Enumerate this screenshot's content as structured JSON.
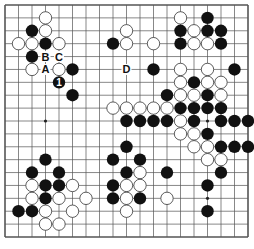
{
  "board": {
    "size": 19,
    "hoshi": [
      [
        3,
        9
      ],
      [
        15,
        9
      ],
      [
        15,
        15
      ]
    ],
    "black": [
      [
        2,
        2
      ],
      [
        3,
        3
      ],
      [
        2,
        4
      ],
      [
        5,
        5
      ],
      [
        5,
        7
      ],
      [
        8,
        3
      ],
      [
        11,
        5
      ],
      [
        15,
        1
      ],
      [
        13,
        2
      ],
      [
        15,
        2
      ],
      [
        16,
        2
      ],
      [
        13,
        3
      ],
      [
        16,
        3
      ],
      [
        17,
        5
      ],
      [
        14,
        6
      ],
      [
        12,
        7
      ],
      [
        15,
        7
      ],
      [
        13,
        8
      ],
      [
        14,
        8
      ],
      [
        15,
        8
      ],
      [
        16,
        8
      ],
      [
        9,
        9
      ],
      [
        10,
        9
      ],
      [
        11,
        9
      ],
      [
        12,
        9
      ],
      [
        14,
        9
      ],
      [
        16,
        9
      ],
      [
        17,
        9
      ],
      [
        18,
        9
      ],
      [
        15,
        10
      ],
      [
        16,
        11
      ],
      [
        17,
        11
      ],
      [
        18,
        11
      ],
      [
        16,
        13
      ],
      [
        15,
        14
      ],
      [
        15,
        16
      ],
      [
        3,
        12
      ],
      [
        2,
        13
      ],
      [
        4,
        13
      ],
      [
        3,
        14
      ],
      [
        4,
        14
      ],
      [
        3,
        15
      ],
      [
        1,
        16
      ],
      [
        2,
        16
      ],
      [
        9,
        11
      ],
      [
        8,
        12
      ],
      [
        10,
        12
      ],
      [
        9,
        13
      ],
      [
        12,
        13
      ],
      [
        8,
        14
      ],
      [
        8,
        15
      ],
      [
        10,
        15
      ]
    ],
    "white": [
      [
        3,
        1
      ],
      [
        3,
        2
      ],
      [
        1,
        3
      ],
      [
        2,
        3
      ],
      [
        4,
        3
      ],
      [
        2,
        5
      ],
      [
        4,
        5
      ],
      [
        9,
        2
      ],
      [
        9,
        3
      ],
      [
        11,
        3
      ],
      [
        13,
        1
      ],
      [
        14,
        2
      ],
      [
        14,
        3
      ],
      [
        15,
        3
      ],
      [
        13,
        5
      ],
      [
        15,
        5
      ],
      [
        13,
        6
      ],
      [
        15,
        6
      ],
      [
        16,
        6
      ],
      [
        13,
        7
      ],
      [
        14,
        7
      ],
      [
        16,
        7
      ],
      [
        8,
        8
      ],
      [
        9,
        8
      ],
      [
        10,
        8
      ],
      [
        11,
        8
      ],
      [
        12,
        8
      ],
      [
        13,
        9
      ],
      [
        13,
        10
      ],
      [
        14,
        10
      ],
      [
        14,
        11
      ],
      [
        15,
        11
      ],
      [
        15,
        12
      ],
      [
        16,
        12
      ],
      [
        2,
        14
      ],
      [
        5,
        14
      ],
      [
        2,
        15
      ],
      [
        4,
        15
      ],
      [
        6,
        15
      ],
      [
        3,
        16
      ],
      [
        5,
        16
      ],
      [
        3,
        17
      ],
      [
        4,
        17
      ],
      [
        10,
        13
      ],
      [
        9,
        14
      ],
      [
        10,
        14
      ],
      [
        9,
        15
      ],
      [
        12,
        15
      ],
      [
        9,
        16
      ]
    ],
    "numbered": [
      {
        "pos": [
          4,
          6
        ],
        "color": "black",
        "label": "1"
      }
    ],
    "labels": [
      {
        "pos": [
          3,
          4
        ],
        "text": "B"
      },
      {
        "pos": [
          4,
          4
        ],
        "text": "C"
      },
      {
        "pos": [
          3,
          5
        ],
        "text": "A"
      },
      {
        "pos": [
          9,
          5
        ],
        "text": "D"
      }
    ]
  },
  "colors": {
    "line": "#555555",
    "black_stone": "#111111",
    "white_stone": "#ffffff",
    "stone_outline": "#333333"
  }
}
